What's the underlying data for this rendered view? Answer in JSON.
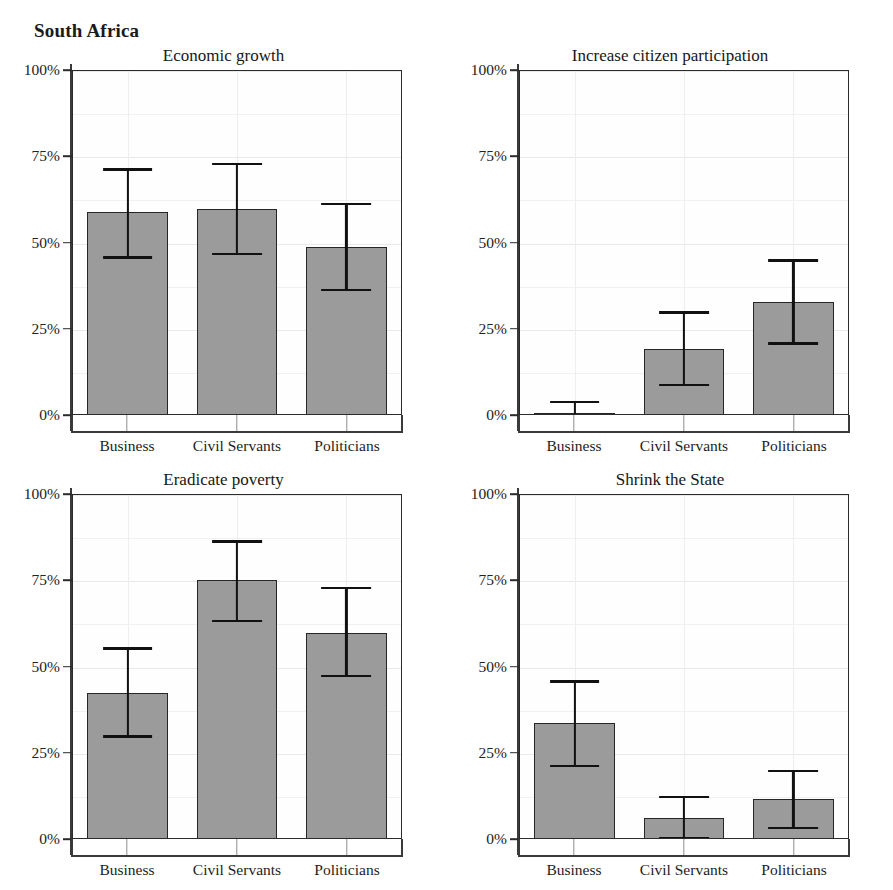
{
  "page": {
    "title": "South Africa"
  },
  "chart_data": {
    "type": "bar",
    "title": "South Africa",
    "xlabel": "",
    "ylabel": "",
    "ylim": [
      0,
      100
    ],
    "ytick_labels": [
      "0%",
      "25%",
      "50%",
      "75%",
      "100%"
    ],
    "ytick_values": [
      0,
      25,
      50,
      75,
      100
    ],
    "grid": true,
    "legend": "none",
    "error_bars": "confidence interval",
    "units": "percent",
    "categories": [
      "Business",
      "Civil Servants",
      "Politicians"
    ],
    "panels": [
      {
        "title": "Economic growth",
        "categories": [
          "Business",
          "Civil Servants",
          "Politicians"
        ],
        "values": [
          59,
          60,
          49
        ],
        "ci_low": [
          46,
          47,
          36.5
        ],
        "ci_high": [
          71.5,
          73,
          61.5
        ]
      },
      {
        "title": "Increase citizen participation",
        "categories": [
          "Business",
          "Civil Servants",
          "Politicians"
        ],
        "values": [
          1,
          19.5,
          33
        ],
        "ci_low": [
          0,
          9,
          21
        ],
        "ci_high": [
          4,
          30,
          45
        ]
      },
      {
        "title": "Eradicate poverty",
        "categories": [
          "Business",
          "Civil Servants",
          "Politicians"
        ],
        "values": [
          42.5,
          75.5,
          60
        ],
        "ci_low": [
          30,
          63.5,
          47.5
        ],
        "ci_high": [
          55.5,
          86.5,
          73
        ]
      },
      {
        "title": "Shrink the State",
        "categories": [
          "Business",
          "Civil Servants",
          "Politicians"
        ],
        "values": [
          34,
          6.5,
          12
        ],
        "ci_low": [
          21.5,
          0.5,
          3.5
        ],
        "ci_high": [
          46,
          12.5,
          20
        ]
      }
    ]
  },
  "colors": {
    "bar_fill": "#9b9b9b",
    "bar_stroke": "#262626",
    "error_bar": "#111111",
    "axis": "#3a3a3a",
    "gridline": "#e9e9ea",
    "background": "#ffffff",
    "text": "#1a1a1a"
  }
}
